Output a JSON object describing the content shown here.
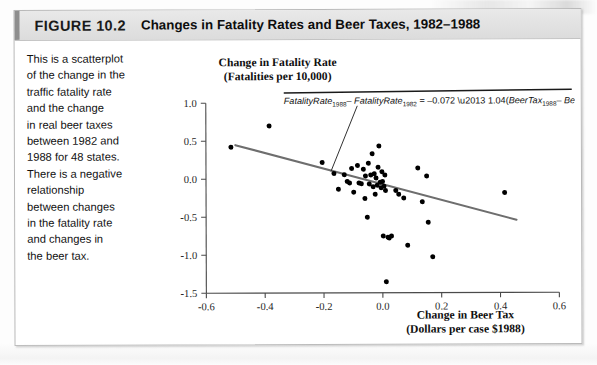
{
  "figure": {
    "number": "FIGURE 10.2",
    "title": "Changes in Fatality Rates and Beer Taxes, 1982–1988"
  },
  "caption": {
    "lines": [
      "This is a scatterplot",
      "of the change in the",
      "traffic fatality rate",
      "and the change",
      "in real beer taxes",
      "between 1982 and",
      "1988 for 48 states.",
      "There is a negative",
      "relationship",
      "between changes",
      "in the fatality rate",
      "and changes in",
      "the beer tax."
    ],
    "full_text": "This is a scatterplot of the change in the traffic fatality rate and the change in real beer taxes between 1982 and 1988 for 48 states. There is a negative relationship between changes in the fatality rate and changes in the beer tax."
  },
  "annotation": {
    "equation_plain": "FatalityRate_1988 - FatalityRate_1982 = -0.072 - 1.04(BeerTax_1988 - BeerTax_1982)",
    "lhs_var": "FatalityRate",
    "lhs_sub1": "1988",
    "minus": "–",
    "lhs_sub2": "1982",
    "equals": "=",
    "intercept": "–0.072",
    "slope_sign": "–",
    "slope": "1.04",
    "rhs_var": "BeerTax",
    "rhs_sub1": "1988",
    "rhs_sub2": "1982"
  },
  "chart_data": {
    "type": "scatter",
    "title": "Changes in Fatality Rates and Beer Taxes, 1982–1988",
    "xlabel": "Change in Beer Tax",
    "xlabel_units": "(Dollars per case $1988)",
    "ylabel": "Change in Fatality Rate",
    "ylabel_units": "(Fatalities per 10,000)",
    "xlim": [
      -0.6,
      0.6
    ],
    "ylim": [
      -1.5,
      1.0
    ],
    "xticks": [
      "-0.6",
      "-0.4",
      "-0.2",
      "0.0",
      "0.2",
      "0.4",
      "0.6"
    ],
    "xtick_values": [
      -0.6,
      -0.4,
      -0.2,
      0.0,
      0.2,
      0.4,
      0.6
    ],
    "yticks": [
      "1.0",
      "0.5",
      "0.0",
      "-0.5",
      "-1.0",
      "-1.5"
    ],
    "ytick_values": [
      1.0,
      0.5,
      0.0,
      -0.5,
      -1.0,
      -1.5
    ],
    "grid": false,
    "legend": "none",
    "regression_line": {
      "intercept": -0.072,
      "slope": -1.04,
      "x_start": -0.5,
      "y_start": 0.448,
      "x_end": 0.455,
      "y_end": -0.545,
      "color": "#6e6e6e"
    },
    "marker_color": "#000000",
    "n_points": 48,
    "points": [
      [
        -0.515,
        0.42
      ],
      [
        -0.385,
        0.7
      ],
      [
        -0.205,
        0.215
      ],
      [
        -0.165,
        0.07
      ],
      [
        -0.15,
        -0.135
      ],
      [
        -0.13,
        0.055
      ],
      [
        -0.12,
        -0.035
      ],
      [
        -0.112,
        -0.055
      ],
      [
        -0.105,
        0.135
      ],
      [
        -0.098,
        -0.175
      ],
      [
        -0.085,
        0.175
      ],
      [
        -0.08,
        -0.055
      ],
      [
        -0.072,
        -0.065
      ],
      [
        -0.065,
        0.125
      ],
      [
        -0.06,
        -0.26
      ],
      [
        -0.058,
        0.038
      ],
      [
        -0.052,
        -0.505
      ],
      [
        -0.048,
        0.205
      ],
      [
        -0.045,
        -0.07
      ],
      [
        -0.04,
        0.05
      ],
      [
        -0.035,
        0.33
      ],
      [
        -0.032,
        -0.105
      ],
      [
        -0.028,
        0.065
      ],
      [
        -0.025,
        -0.205
      ],
      [
        -0.022,
        0.01
      ],
      [
        -0.018,
        -0.085
      ],
      [
        -0.015,
        0.15
      ],
      [
        -0.012,
        0.43
      ],
      [
        -0.008,
        -0.045
      ],
      [
        -0.005,
        -0.12
      ],
      [
        -0.002,
        0.092
      ],
      [
        0.0,
        -0.035
      ],
      [
        0.002,
        -0.755
      ],
      [
        0.005,
        -0.1
      ],
      [
        0.008,
        0.048
      ],
      [
        0.01,
        -0.155
      ],
      [
        0.012,
        -1.355
      ],
      [
        0.018,
        -0.77
      ],
      [
        0.022,
        -0.78
      ],
      [
        0.03,
        -0.755
      ],
      [
        0.045,
        -0.155
      ],
      [
        0.055,
        -0.205
      ],
      [
        0.072,
        -0.255
      ],
      [
        0.085,
        -0.875
      ],
      [
        0.12,
        0.14
      ],
      [
        0.135,
        -0.305
      ],
      [
        0.15,
        0.035
      ],
      [
        0.155,
        -0.575
      ],
      [
        0.17,
        -1.03
      ],
      [
        0.415,
        -0.185
      ]
    ]
  }
}
